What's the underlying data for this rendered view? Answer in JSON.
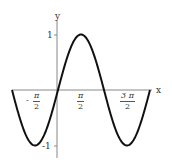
{
  "chart_data": {
    "type": "line",
    "title": "",
    "xlabel": "x",
    "ylabel": "y",
    "function": "sin(x)",
    "xlim": [
      -3.1416,
      6.2832
    ],
    "ylim": [
      -1.1,
      1.1
    ],
    "grid": false,
    "x_ticks": [
      {
        "value": -1.5708,
        "num": "π",
        "den": "2",
        "sign": "-"
      },
      {
        "value": 1.5708,
        "num": "π",
        "den": "2",
        "sign": ""
      },
      {
        "value": 4.7124,
        "num": "3 π",
        "den": "2",
        "sign": ""
      }
    ],
    "y_ticks": [
      {
        "value": 1,
        "label": "1"
      },
      {
        "value": -1,
        "label": "-1"
      }
    ],
    "x": [
      -3.1416,
      -1.5708,
      0,
      1.5708,
      3.1416,
      4.7124,
      6.2832
    ],
    "series": [
      {
        "name": "sin(x)",
        "values": [
          0,
          -1,
          0,
          1,
          0,
          -1,
          0
        ]
      }
    ]
  },
  "axes": {
    "x_label": "x",
    "y_label": "y",
    "y_tick_1": "1",
    "y_tick_m1": "-1"
  },
  "ticks": {
    "t1_sign": "-",
    "t1_num": "π",
    "t1_den": "2",
    "t2_num": "π",
    "t2_den": "2",
    "t3_num": "3 π",
    "t3_den": "2"
  }
}
